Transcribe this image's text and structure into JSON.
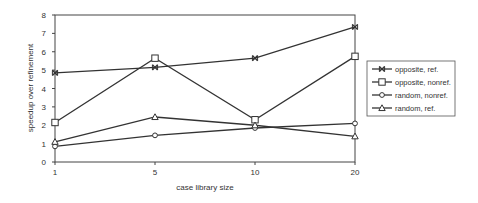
{
  "chart_data": {
    "type": "line",
    "title": "",
    "xlabel": "case library size",
    "ylabel": "speedup over refinement",
    "categories": [
      "1",
      "5",
      "10",
      "20"
    ],
    "ylim": [
      0,
      8
    ],
    "yticks": [
      0,
      1,
      2,
      3,
      4,
      5,
      6,
      7,
      8
    ],
    "grid": false,
    "legend_position": "right",
    "series": [
      {
        "name": "opposite, ref.",
        "marker": "asterisk",
        "values": [
          4.85,
          5.15,
          5.65,
          7.35
        ]
      },
      {
        "name": "opposite, nonref.",
        "marker": "square",
        "values": [
          2.15,
          5.65,
          2.3,
          5.75
        ]
      },
      {
        "name": "random,  nonref.",
        "marker": "circle",
        "values": [
          0.85,
          1.45,
          1.85,
          2.1
        ]
      },
      {
        "name": "random, ref.",
        "marker": "triangle",
        "values": [
          1.1,
          2.45,
          2.0,
          1.4
        ]
      }
    ]
  },
  "colors": {
    "line": "#333333",
    "marker_fill": "#ffffff",
    "frame": "#444444"
  }
}
